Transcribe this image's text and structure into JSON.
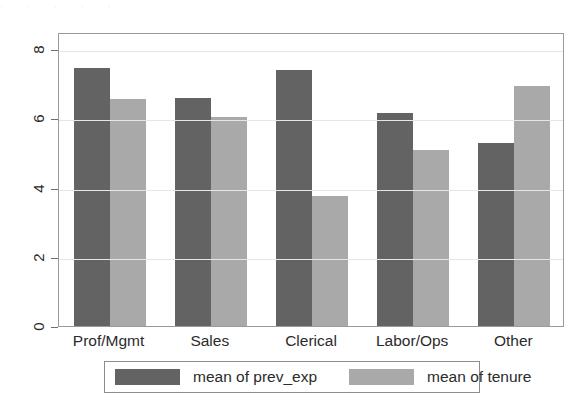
{
  "artifact": {
    "top_strip_text": "· · · · ·"
  },
  "chart_data": {
    "type": "bar",
    "title": "",
    "subtitle": "",
    "xlabel": "",
    "ylabel": "",
    "categories": [
      "Prof/Mgmt",
      "Sales",
      "Clerical",
      "Labor/Ops",
      "Other"
    ],
    "series": [
      {
        "name": "mean of prev_exp",
        "color": "#636363",
        "values": [
          7.45,
          6.6,
          7.4,
          6.15,
          5.3
        ]
      },
      {
        "name": "mean of tenure",
        "color": "#a9a9a9",
        "values": [
          6.55,
          6.05,
          3.75,
          5.1,
          6.95
        ]
      }
    ],
    "ylim": [
      0,
      8.5
    ],
    "yticks": [
      0,
      2,
      4,
      6,
      8
    ],
    "ytick_labels": [
      "0",
      "2",
      "4",
      "6",
      "8"
    ],
    "grid": true,
    "grid_axis": "y",
    "legend_position": "bottom",
    "legend_entries": [
      "mean of prev_exp",
      "mean of tenure"
    ]
  },
  "axes": {
    "y_tick_labels": [
      "8",
      "6",
      "4",
      "2",
      "0"
    ]
  },
  "legend": {
    "entries": [
      {
        "label": "mean of prev_exp",
        "color": "#636363"
      },
      {
        "label": "mean of tenure",
        "color": "#a9a9a9"
      }
    ]
  }
}
